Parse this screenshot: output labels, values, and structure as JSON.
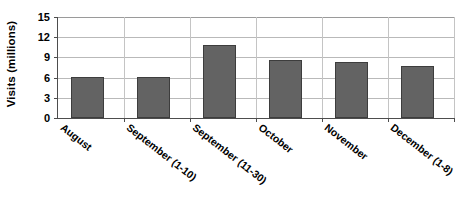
{
  "chart_data": {
    "type": "bar",
    "title": "",
    "subtitle": "",
    "xlabel": "",
    "ylabel": "Visits (millions)",
    "categories": [
      "August",
      "September (1-10)",
      "September (11-30)",
      "October",
      "November",
      "December (1-8)"
    ],
    "values": [
      6.1,
      6.1,
      10.9,
      8.6,
      8.3,
      7.7
    ],
    "ylim": [
      0,
      15
    ],
    "yticks": [
      0,
      3,
      6,
      9,
      12,
      15
    ],
    "ytick_labels": [
      "0",
      "3",
      "6",
      "9",
      "12",
      "15"
    ],
    "grid": true,
    "grid_axis": "y",
    "legend": false,
    "legend_position": "none",
    "bar_color": "#636363",
    "bar_edge_color": "#3d3d3d",
    "background_color": "#ffffff",
    "gridline_color": "#b9b9b9",
    "axis_color": "#4d4d4d",
    "xtick_label_rotation": 38
  }
}
